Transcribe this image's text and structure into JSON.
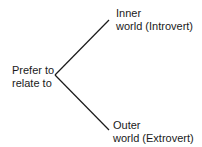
{
  "root": {
    "line1": "Prefer to",
    "line2": "relate to"
  },
  "branches": [
    {
      "line1": "Inner",
      "line2": "world  (Introvert)"
    },
    {
      "line1": "Outer",
      "line2": "world  (Extrovert)"
    }
  ],
  "colors": {
    "line": "#1a1a1a",
    "text": "#1a1a1a",
    "background": "#ffffff"
  }
}
